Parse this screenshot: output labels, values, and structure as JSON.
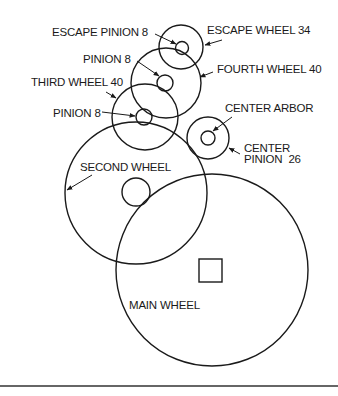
{
  "diagram": {
    "colors": {
      "stroke": "#1a1a1a",
      "background": "#ffffff"
    },
    "components": [
      {
        "id": "escape_wheel",
        "label": "ESCAPE WHEEL 34",
        "teeth": 34
      },
      {
        "id": "escape_pinion",
        "label": "ESCAPE PINION 8",
        "teeth": 8
      },
      {
        "id": "fourth_wheel",
        "label": "FOURTH WHEEL 40",
        "teeth": 40
      },
      {
        "id": "fourth_pinion",
        "label": "PINION 8",
        "teeth": 8
      },
      {
        "id": "third_wheel",
        "label": "THIRD WHEEL 40",
        "teeth": 40
      },
      {
        "id": "third_pinion",
        "label": "PINION 8",
        "teeth": 8
      },
      {
        "id": "center_arbor",
        "label": "CENTER ARBOR"
      },
      {
        "id": "center_pinion",
        "label_line1": "CENTER",
        "label_line2": "PINION  26",
        "teeth": 26
      },
      {
        "id": "second_wheel",
        "label": "SECOND WHEEL"
      },
      {
        "id": "main_wheel",
        "label": "MAIN WHEEL"
      }
    ]
  }
}
